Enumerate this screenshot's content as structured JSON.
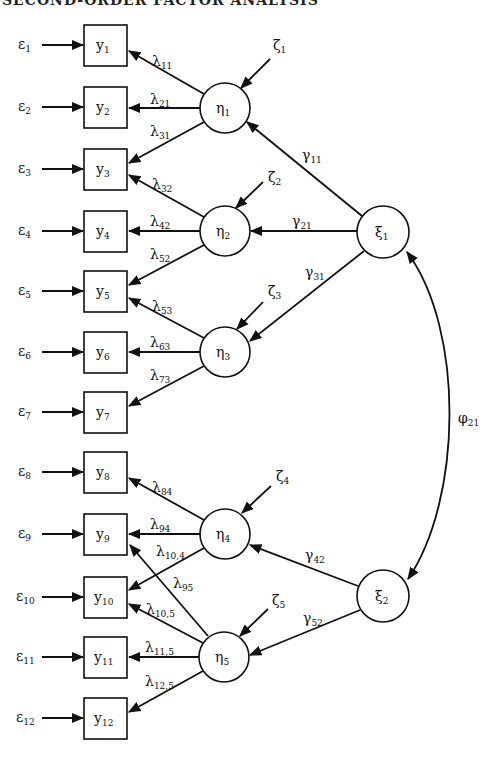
{
  "header": {
    "title": "SECOND-ORDER FACTOR ANALYSIS"
  },
  "diagram": {
    "type": "structural-equation-path-diagram",
    "observed": [
      {
        "id": "y1",
        "base": "y",
        "sub": "1",
        "cy": 45
      },
      {
        "id": "y2",
        "base": "y",
        "sub": "2",
        "cy": 107
      },
      {
        "id": "y3",
        "base": "y",
        "sub": "3",
        "cy": 169
      },
      {
        "id": "y4",
        "base": "y",
        "sub": "4",
        "cy": 231
      },
      {
        "id": "y5",
        "base": "y",
        "sub": "5",
        "cy": 291
      },
      {
        "id": "y6",
        "base": "y",
        "sub": "6",
        "cy": 352
      },
      {
        "id": "y7",
        "base": "y",
        "sub": "7",
        "cy": 412
      },
      {
        "id": "y8",
        "base": "y",
        "sub": "8",
        "cy": 472
      },
      {
        "id": "y9",
        "base": "y",
        "sub": "9",
        "cy": 534
      },
      {
        "id": "y10",
        "base": "y",
        "sub": "10",
        "cy": 597
      },
      {
        "id": "y11",
        "base": "y",
        "sub": "11",
        "cy": 657
      },
      {
        "id": "y12",
        "base": "y",
        "sub": "12",
        "cy": 718
      }
    ],
    "errors": [
      {
        "id": "e1",
        "base": "ε",
        "sub": "1"
      },
      {
        "id": "e2",
        "base": "ε",
        "sub": "2"
      },
      {
        "id": "e3",
        "base": "ε",
        "sub": "3"
      },
      {
        "id": "e4",
        "base": "ε",
        "sub": "4"
      },
      {
        "id": "e5",
        "base": "ε",
        "sub": "5"
      },
      {
        "id": "e6",
        "base": "ε",
        "sub": "6"
      },
      {
        "id": "e7",
        "base": "ε",
        "sub": "7"
      },
      {
        "id": "e8",
        "base": "ε",
        "sub": "8"
      },
      {
        "id": "e9",
        "base": "ε",
        "sub": "9"
      },
      {
        "id": "e10",
        "base": "ε",
        "sub": "10"
      },
      {
        "id": "e11",
        "base": "ε",
        "sub": "11"
      },
      {
        "id": "e12",
        "base": "ε",
        "sub": "12"
      }
    ],
    "first_order": [
      {
        "id": "eta1",
        "base": "η",
        "sub": "1",
        "cx": 225,
        "cy": 108
      },
      {
        "id": "eta2",
        "base": "η",
        "sub": "2",
        "cx": 225,
        "cy": 231
      },
      {
        "id": "eta3",
        "base": "η",
        "sub": "3",
        "cx": 225,
        "cy": 352
      },
      {
        "id": "eta4",
        "base": "η",
        "sub": "4",
        "cx": 225,
        "cy": 534
      },
      {
        "id": "eta5",
        "base": "η",
        "sub": "5",
        "cx": 224,
        "cy": 657
      }
    ],
    "disturbances": [
      {
        "id": "zeta1",
        "base": "ζ",
        "sub": "1"
      },
      {
        "id": "zeta2",
        "base": "ζ",
        "sub": "2"
      },
      {
        "id": "zeta3",
        "base": "ζ",
        "sub": "3"
      },
      {
        "id": "zeta4",
        "base": "ζ",
        "sub": "4"
      },
      {
        "id": "zeta5",
        "base": "ζ",
        "sub": "5"
      }
    ],
    "second_order": [
      {
        "id": "xi1",
        "base": "ξ",
        "sub": "1",
        "cx": 383,
        "cy": 232
      },
      {
        "id": "xi2",
        "base": "ξ",
        "sub": "2",
        "cx": 383,
        "cy": 596
      }
    ],
    "loadings": [
      {
        "from": "eta1",
        "to": "y1",
        "base": "λ",
        "sub": "11"
      },
      {
        "from": "eta1",
        "to": "y2",
        "base": "λ",
        "sub": "21"
      },
      {
        "from": "eta1",
        "to": "y3",
        "base": "λ",
        "sub": "31"
      },
      {
        "from": "eta2",
        "to": "y3",
        "base": "λ",
        "sub": "32"
      },
      {
        "from": "eta2",
        "to": "y4",
        "base": "λ",
        "sub": "42"
      },
      {
        "from": "eta2",
        "to": "y5",
        "base": "λ",
        "sub": "52"
      },
      {
        "from": "eta3",
        "to": "y5",
        "base": "λ",
        "sub": "53"
      },
      {
        "from": "eta3",
        "to": "y6",
        "base": "λ",
        "sub": "63"
      },
      {
        "from": "eta3",
        "to": "y7",
        "base": "λ",
        "sub": "73"
      },
      {
        "from": "eta4",
        "to": "y8",
        "base": "λ",
        "sub": "84"
      },
      {
        "from": "eta4",
        "to": "y9",
        "base": "λ",
        "sub": "94"
      },
      {
        "from": "eta4",
        "to": "y10",
        "base": "λ",
        "sub": "10,4"
      },
      {
        "from": "eta5",
        "to": "y9",
        "base": "λ",
        "sub": "95"
      },
      {
        "from": "eta5",
        "to": "y10",
        "base": "λ",
        "sub": "10,5"
      },
      {
        "from": "eta5",
        "to": "y11",
        "base": "λ",
        "sub": "11,5"
      },
      {
        "from": "eta5",
        "to": "y12",
        "base": "λ",
        "sub": "12,5"
      }
    ],
    "gammas": [
      {
        "from": "xi1",
        "to": "eta1",
        "base": "γ",
        "sub": "11"
      },
      {
        "from": "xi1",
        "to": "eta2",
        "base": "γ",
        "sub": "21"
      },
      {
        "from": "xi1",
        "to": "eta3",
        "base": "γ",
        "sub": "31"
      },
      {
        "from": "xi2",
        "to": "eta4",
        "base": "γ",
        "sub": "42"
      },
      {
        "from": "xi2",
        "to": "eta5",
        "base": "γ",
        "sub": "52"
      }
    ],
    "covariance": {
      "between": [
        "xi1",
        "xi2"
      ],
      "base": "φ",
      "sub": "21"
    }
  }
}
